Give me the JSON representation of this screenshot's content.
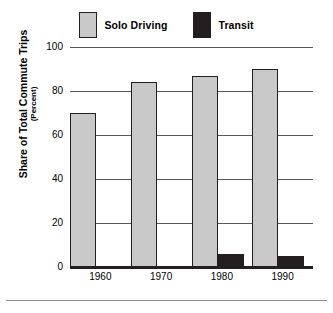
{
  "chart_data": {
    "type": "bar",
    "title": "",
    "subtitle": "",
    "xlabel": "",
    "ylabel": "Share of Total Commute Trips",
    "ylabel_sub": "(Percent)",
    "categories": [
      "1960",
      "1970",
      "1980",
      "1990"
    ],
    "series": [
      {
        "name": "Solo Driving",
        "values": [
          70,
          84,
          87,
          90
        ],
        "color": "#c9c9c9"
      },
      {
        "name": "Transit",
        "values": [
          0,
          0,
          6,
          5
        ],
        "color": "#231f20"
      }
    ],
    "ylim": [
      0,
      100
    ],
    "yticks": [
      0,
      20,
      40,
      60,
      80,
      100
    ],
    "ytick_labels": [
      "0",
      "20",
      "40",
      "60",
      "80",
      "100"
    ],
    "grid": true,
    "legend_position": "top-center",
    "legend": [
      {
        "label": "Solo Driving",
        "swatch": "#c9c9c9"
      },
      {
        "label": "Transit",
        "swatch": "#231f20"
      }
    ]
  },
  "colors": {
    "solo_driving": "#c9c9c9",
    "transit": "#231f20",
    "gridline": "#58595b",
    "axis": "#231f20",
    "background": "#ffffff"
  }
}
